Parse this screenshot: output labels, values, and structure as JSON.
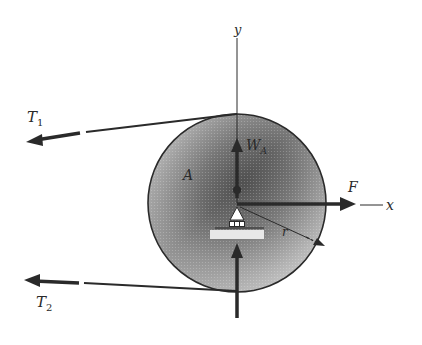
{
  "diagram": {
    "type": "free-body diagram of pulley",
    "labels": {
      "y_axis": "y",
      "x_axis": "x",
      "tension_1": "T",
      "tension_1_sub": "1",
      "tension_2": "T",
      "tension_2_sub": "2",
      "weight": "W",
      "weight_sub": "A",
      "body": "A",
      "force": "F",
      "radius": "r"
    },
    "colors": {
      "ink": "#2a2a2a",
      "disk_dark": "#4a4a4a",
      "disk_light": "#d8d8d8",
      "background": "#ffffff"
    },
    "geometry": {
      "center": [
        237,
        203
      ],
      "radius": 89
    }
  }
}
